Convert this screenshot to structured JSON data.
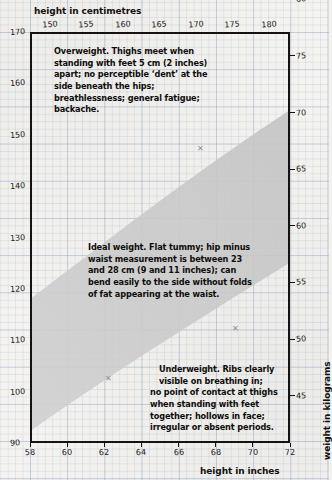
{
  "chart_data": {
    "type": "area",
    "xlabel": "height in inches",
    "ylabel": "weight in pounds",
    "x2label": "height in centimetres",
    "y2label": "weight in kilograms",
    "xlim": [
      58,
      72
    ],
    "ylim": [
      90,
      170
    ],
    "x2lim": [
      147.32,
      182.88
    ],
    "y2lim": [
      40.8,
      77.1
    ],
    "grid": true,
    "legend": "none",
    "x_ticks_inches": [
      58,
      60,
      62,
      64,
      66,
      68,
      70,
      72
    ],
    "x2_ticks_cm": [
      150,
      155,
      160,
      165,
      170,
      175,
      180
    ],
    "y_ticks_pounds": [
      90,
      100,
      110,
      120,
      130,
      140,
      150,
      160,
      170
    ],
    "y2_ticks_kg": [
      45,
      50,
      55,
      60,
      65,
      70,
      75,
      80
    ],
    "series": [
      {
        "name": "ideal weight band upper bound",
        "x": [
          58,
          60,
          62,
          64,
          66,
          68,
          70,
          72
        ],
        "values": [
          118,
          124,
          131,
          139,
          147,
          155,
          163,
          171
        ]
      },
      {
        "name": "ideal weight band lower bound",
        "x": [
          58,
          60,
          62,
          64,
          66,
          68,
          70,
          72
        ],
        "values": [
          92,
          97,
          103,
          109,
          116,
          123,
          130,
          137
        ]
      }
    ],
    "regions": [
      {
        "name": "Overweight",
        "position": "above band"
      },
      {
        "name": "Ideal weight",
        "position": "inside band"
      },
      {
        "name": "Underweight",
        "position": "below band"
      }
    ]
  },
  "axes": {
    "top": {
      "title": "height in centimetres",
      "ticks": [
        "150",
        "155",
        "160",
        "165",
        "170",
        "175",
        "180"
      ]
    },
    "bottom": {
      "title": "height in inches",
      "ticks": [
        "58",
        "60",
        "62",
        "64",
        "66",
        "68",
        "70",
        "72"
      ]
    },
    "left": {
      "title": "weight in pounds",
      "ticks": [
        "170",
        "160",
        "150",
        "140",
        "130",
        "120",
        "110",
        "100",
        "90"
      ]
    },
    "right": {
      "title": "weight in kilograms",
      "ticks": [
        "80",
        "75",
        "70",
        "65",
        "60",
        "55",
        "50",
        "45"
      ]
    }
  },
  "notes": {
    "overweight": "Overweight. Thighs meet when standing with feet 5 cm (2 inches) apart; no perceptible ‘dent’ at the side beneath the hips; breathlessness; general fatigue; backache.",
    "ideal": "Ideal weight. Flat tummy; hip minus waist measurement is between 23 and 28 cm (9 and 11 inches); can bend easily to the side without folds of fat appearing at the waist.",
    "underweight_line1": "Underweight. Ribs clearly",
    "underweight_line2": "visible on breathing in;",
    "underweight_rest": "no point of contact at thighs when standing with feet together; hollows in face; irregular or absent periods."
  },
  "colors": {
    "paper": "#f5f3ef",
    "grid": "#7896be",
    "band": "#c8c8c8",
    "ink": "#15120f"
  }
}
